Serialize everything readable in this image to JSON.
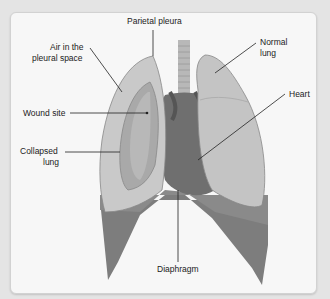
{
  "diagram": {
    "labels": {
      "parietal_pleura": "Parietal pleura",
      "air_pleural_space_1": "Air in the",
      "air_pleural_space_2": "pleural space",
      "normal_lung_1": "Normal",
      "normal_lung_2": "lung",
      "wound_site": "Wound site",
      "heart": "Heart",
      "collapsed_lung_1": "Collapsed",
      "collapsed_lung_2": "lung",
      "diaphragm": "Diaphragm"
    },
    "colors": {
      "pleural_space": "#c9c9c9",
      "collapsed_lung": "#a9a9a9",
      "normal_lung": "#c4c4c4",
      "heart": "#6f6f6f",
      "diaphragm": "#7d7d7d",
      "trachea": "#b8b8b8"
    }
  }
}
